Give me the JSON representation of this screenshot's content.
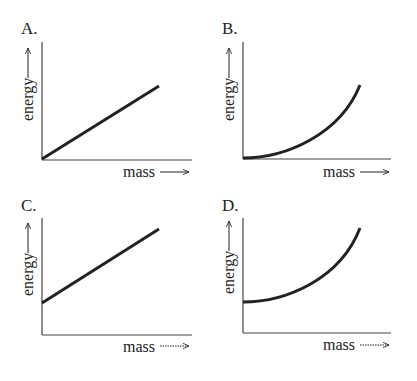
{
  "panels": [
    {
      "label": "A.",
      "ylabel": "energy",
      "xlabel": "mass",
      "shape": "linear through origin"
    },
    {
      "label": "B.",
      "ylabel": "energy",
      "xlabel": "mass",
      "shape": "exponential-like curve from origin"
    },
    {
      "label": "C.",
      "ylabel": "energy",
      "xlabel": "mass",
      "shape": "linear with positive intercept"
    },
    {
      "label": "D.",
      "ylabel": "energy",
      "xlabel": "mass",
      "shape": "exponential-like curve with positive intercept"
    }
  ],
  "colors": {
    "ink": "#222222",
    "background": "#ffffff"
  }
}
